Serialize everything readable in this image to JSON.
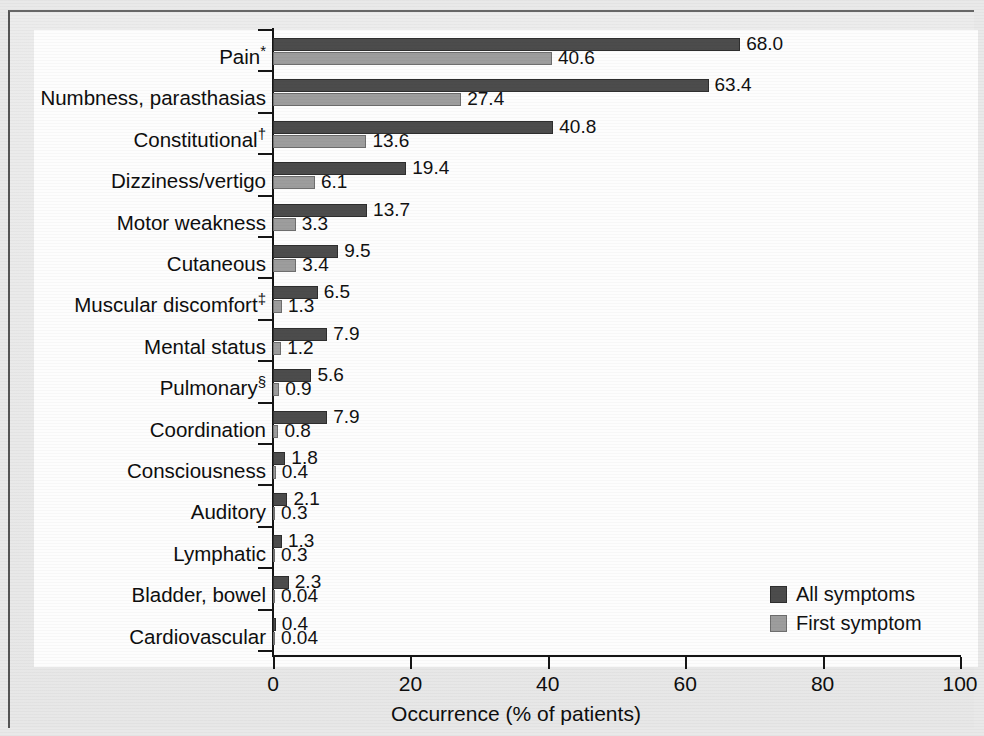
{
  "chart_data": {
    "type": "bar",
    "orientation": "horizontal",
    "title": "",
    "xlabel": "Occurrence (% of patients)",
    "ylabel": "",
    "xlim": [
      0,
      100
    ],
    "xticks": [
      0,
      20,
      40,
      60,
      80,
      100
    ],
    "grid": false,
    "legend_position": "bottom-right",
    "categories": [
      "Pain*",
      "Numbness, parasthasias",
      "Constitutional†",
      "Dizziness/vertigo",
      "Motor weakness",
      "Cutaneous",
      "Muscular discomfort‡",
      "Mental status",
      "Pulmonary§",
      "Coordination",
      "Consciousness",
      "Auditory",
      "Lymphatic",
      "Bladder, bowel",
      "Cardiovascular"
    ],
    "series": [
      {
        "name": "All symptoms",
        "color": "#4c4c4c",
        "values": [
          68.0,
          63.4,
          40.8,
          19.4,
          13.7,
          9.5,
          6.5,
          7.9,
          5.6,
          7.9,
          1.8,
          2.1,
          1.3,
          2.3,
          0.4
        ],
        "labels": [
          "68.0",
          "63.4",
          "40.8",
          "19.4",
          "13.7",
          "9.5",
          "6.5",
          "7.9",
          "5.6",
          "7.9",
          "1.8",
          "2.1",
          "1.3",
          "2.3",
          "0.4"
        ]
      },
      {
        "name": "First symptom",
        "color": "#9d9d9d",
        "values": [
          40.6,
          27.4,
          13.6,
          6.1,
          3.3,
          3.4,
          1.3,
          1.2,
          0.9,
          0.8,
          0.4,
          0.3,
          0.3,
          0.04,
          0.04
        ],
        "labels": [
          "40.6",
          "27.4",
          "13.6",
          "6.1",
          "3.3",
          "3.4",
          "1.3",
          "1.2",
          "0.9",
          "0.8",
          "0.4",
          "0.3",
          "0.3",
          "0.04",
          "0.04"
        ]
      }
    ]
  },
  "legend": {
    "items": [
      {
        "label": "All symptoms",
        "color": "#4c4c4c"
      },
      {
        "label": "First symptom",
        "color": "#9d9d9d"
      }
    ]
  },
  "axis": {
    "x_title": "Occurrence (% of patients)",
    "x_tick_labels": [
      "0",
      "20",
      "40",
      "60",
      "80",
      "100"
    ]
  },
  "footnote_symbols": {
    "pain": "*",
    "constitutional": "†",
    "muscular": "‡",
    "pulmonary": "§"
  }
}
